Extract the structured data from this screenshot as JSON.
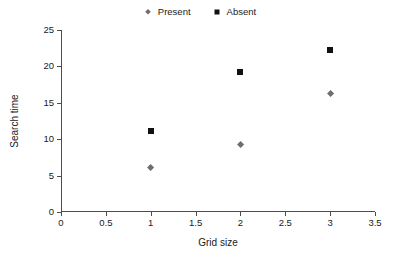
{
  "chart_data": {
    "type": "scatter",
    "title": "",
    "xlabel": "Grid size",
    "ylabel": "Search time",
    "xlim": [
      0,
      3.5
    ],
    "ylim": [
      0,
      25
    ],
    "xticks": [
      "0",
      "0.5",
      "1",
      "1.5",
      "2",
      "2.5",
      "3",
      "3.5"
    ],
    "xtick_values": [
      0,
      0.5,
      1,
      1.5,
      2,
      2.5,
      3,
      3.5
    ],
    "yticks": [
      "0",
      "5",
      "10",
      "15",
      "20",
      "25"
    ],
    "ytick_values": [
      0,
      5,
      10,
      15,
      20,
      25
    ],
    "grid": false,
    "legend_position": "top-center",
    "x": [
      1,
      2,
      3
    ],
    "series": [
      {
        "name": "Present",
        "marker": "diamond",
        "color": "#6e6e6e",
        "x": [
          1,
          2,
          3
        ],
        "values": [
          6.1,
          9.2,
          16.3
        ]
      },
      {
        "name": "Absent",
        "marker": "square",
        "color": "#111111",
        "x": [
          1,
          2,
          3
        ],
        "values": [
          11.1,
          19.2,
          22.2
        ]
      }
    ]
  },
  "legend": {
    "entries": [
      {
        "label": "Present",
        "marker": "diamond-marker-icon"
      },
      {
        "label": "Absent",
        "marker": "square-marker-icon"
      }
    ]
  },
  "axes": {
    "x_title": "Grid size",
    "y_title": "Search time"
  }
}
